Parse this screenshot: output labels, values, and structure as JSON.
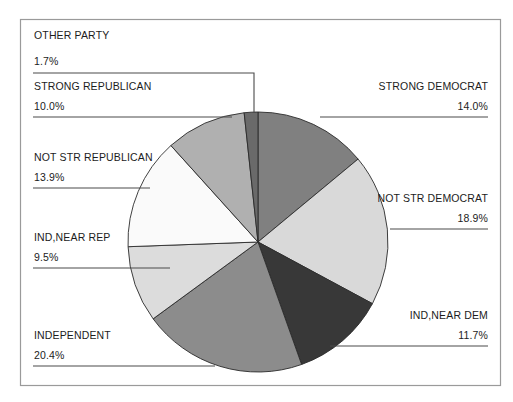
{
  "chart_data": {
    "type": "pie",
    "title": "",
    "subtitle": "",
    "xlabel": "",
    "ylabel": "",
    "legend_position": "none",
    "grid": false,
    "units": "percent",
    "start_angle_deg": 0,
    "direction": "clockwise",
    "categories": [
      "STRONG DEMOCRAT",
      "NOT STR DEMOCRAT",
      "IND,NEAR DEM",
      "INDEPENDENT",
      "IND,NEAR REP",
      "NOT STR REPUBLICAN",
      "STRONG REPUBLICAN",
      "OTHER PARTY"
    ],
    "values": [
      14.0,
      18.9,
      11.7,
      20.4,
      9.5,
      13.9,
      10.0,
      1.7
    ],
    "value_labels": [
      "14.0%",
      "18.9%",
      "11.7%",
      "20.4%",
      "9.5%",
      "13.9%",
      "10.0%",
      "1.7%"
    ],
    "colors": [
      "#808080",
      "#d9d9d9",
      "#383838",
      "#8c8c8c",
      "#dcdcdc",
      "#fafafa",
      "#b0b0b0",
      "#6a6a6a"
    ],
    "slices": [
      {
        "label": "STRONG DEMOCRAT",
        "value": 14.0,
        "value_label": "14.0%",
        "color": "#808080"
      },
      {
        "label": "NOT STR DEMOCRAT",
        "value": 18.9,
        "value_label": "18.9%",
        "color": "#d9d9d9"
      },
      {
        "label": "IND,NEAR DEM",
        "value": 11.7,
        "value_label": "11.7%",
        "color": "#383838"
      },
      {
        "label": "INDEPENDENT",
        "value": 20.4,
        "value_label": "20.4%",
        "color": "#8c8c8c"
      },
      {
        "label": "IND,NEAR REP",
        "value": 9.5,
        "value_label": "9.5%",
        "color": "#dcdcdc"
      },
      {
        "label": "NOT STR REPUBLICAN",
        "value": 13.9,
        "value_label": "13.9%",
        "color": "#fafafa"
      },
      {
        "label": "STRONG REPUBLICAN",
        "value": 10.0,
        "value_label": "10.0%",
        "color": "#b0b0b0"
      },
      {
        "label": "OTHER PARTY",
        "value": 1.7,
        "value_label": "1.7%",
        "color": "#6a6a6a"
      }
    ]
  },
  "frame": {
    "border_color": "#9a9a9a",
    "background": "#ffffff"
  },
  "labels": {
    "other_party": {
      "name": "OTHER PARTY",
      "percent": "1.7%"
    },
    "strong_republican": {
      "name": "STRONG REPUBLICAN",
      "percent": "10.0%"
    },
    "not_str_republican": {
      "name": "NOT STR REPUBLICAN",
      "percent": "13.9%"
    },
    "ind_near_rep": {
      "name": "IND,NEAR REP",
      "percent": "9.5%"
    },
    "independent": {
      "name": "INDEPENDENT",
      "percent": "20.4%"
    },
    "strong_democrat": {
      "name": "STRONG DEMOCRAT",
      "percent": "14.0%"
    },
    "not_str_democrat": {
      "name": "NOT STR DEMOCRAT",
      "percent": "18.9%"
    },
    "ind_near_dem": {
      "name": "IND,NEAR DEM",
      "percent": "11.7%"
    }
  }
}
